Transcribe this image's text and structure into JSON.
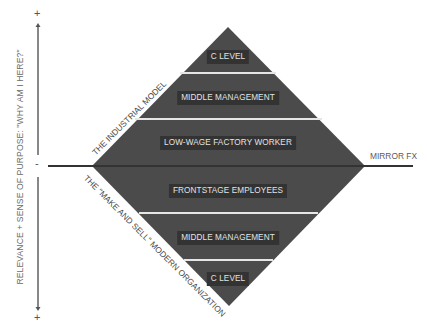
{
  "axis": {
    "label": "RELEVANCE + SENSE OF PURPOSE:  \"WHY AM I HERE?\"",
    "top_sign": "+",
    "middle_sign": "-",
    "bottom_sign": "+"
  },
  "diamond": {
    "fill": "#4b4b4b",
    "label_bg": "#333333",
    "separator_color": "#e6e6e6",
    "top_half": {
      "title": "THE INDUSTRIAL MODEL",
      "bands": [
        {
          "label": "C LEVEL"
        },
        {
          "label": "MIDDLE MANAGEMENT"
        },
        {
          "label": "LOW-WAGE FACTORY WORKER"
        }
      ]
    },
    "bottom_half": {
      "title": "THE \"MAKE AND SELL\" MODERN ORGANIZATION",
      "bands": [
        {
          "label": "FRONTSTAGE EMPLOYEES"
        },
        {
          "label": "MIDDLE MANAGEMENT"
        },
        {
          "label": "C LEVEL"
        }
      ]
    }
  },
  "mirror_line": {
    "label": "MIRROR FX",
    "color": "#3a3a3a"
  }
}
